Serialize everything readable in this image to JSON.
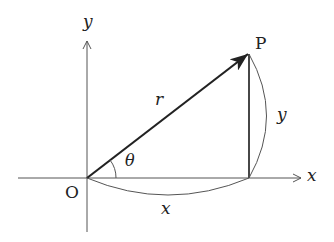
{
  "diagram": {
    "type": "polar-coordinates",
    "labels": {
      "origin": "O",
      "point": "P",
      "x_axis": "x",
      "y_axis": "y",
      "radius": "r",
      "angle": "θ",
      "x_length": "x",
      "y_length": "y"
    },
    "colors": {
      "axis": "#555555",
      "vector": "#222222",
      "brace": "#555555",
      "text": "#222222"
    },
    "geometry": {
      "origin": [
        87,
        178
      ],
      "point_p": [
        249,
        53
      ],
      "x_axis_range": [
        18,
        302
      ],
      "y_axis_range": [
        40,
        232
      ],
      "angle_arc_radius": 29
    }
  }
}
